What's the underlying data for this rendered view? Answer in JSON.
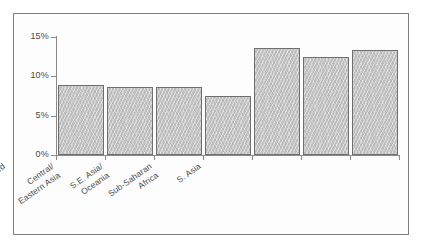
{
  "figure": {
    "title": "",
    "frame_color": "#7e7e7e",
    "background_color": "#ffffff",
    "bar_fill_color": "#c9c9c9",
    "bar_edge_color": "#6f6f6f",
    "axis_color": "#8a8a8a",
    "text_color": "#4d4d4d"
  },
  "chart_data": {
    "type": "bar",
    "title": "",
    "xlabel": "",
    "ylabel": "",
    "ylim": [
      0,
      15
    ],
    "grid": false,
    "legend": null,
    "ytick_labels": [
      "0%",
      "5%",
      "10%",
      "15%"
    ],
    "ytick_values": [
      0,
      5,
      10,
      15
    ],
    "categories": [
      "N. Africa and\nW. Asia",
      "Latin America and\nCaribbean",
      "Developed",
      "Central/\nEastern Asia",
      "S.E. Asia/\nOceania",
      "Sub-Saharan\nAfrica",
      "S. Asia"
    ],
    "values": [
      8.9,
      8.6,
      8.6,
      7.5,
      13.6,
      12.4,
      13.4
    ],
    "value_unit": "%"
  }
}
